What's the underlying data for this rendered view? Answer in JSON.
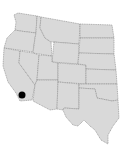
{
  "map": {
    "region": "Western United States",
    "fill_color": "#d9d9d9",
    "border_color": "#8a8a8a",
    "background": "#ffffff",
    "marker": {
      "location": "Southern California",
      "color": "#000000",
      "x": 22,
      "y": 95,
      "radius": 3.5
    },
    "states": [
      "WA",
      "OR",
      "CA",
      "ID",
      "NV",
      "MT",
      "WY",
      "UT",
      "AZ",
      "CO",
      "NM",
      "ND",
      "SD",
      "NE",
      "KS",
      "OK",
      "TX"
    ]
  }
}
